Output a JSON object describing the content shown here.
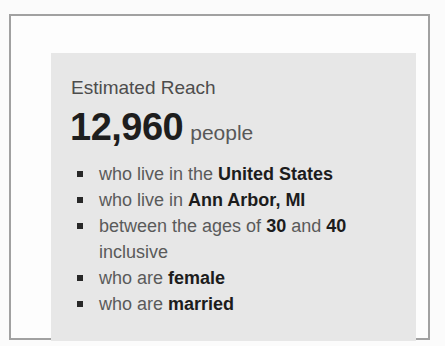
{
  "panel": {
    "title": "Estimated Reach",
    "reach_count": "12,960",
    "reach_unit": "people",
    "criteria": [
      {
        "segments": [
          {
            "t": "who live in the ",
            "b": false
          },
          {
            "t": "United States",
            "b": true
          }
        ]
      },
      {
        "segments": [
          {
            "t": "who live in ",
            "b": false
          },
          {
            "t": "Ann Arbor, MI",
            "b": true
          }
        ]
      },
      {
        "segments": [
          {
            "t": "between the ages of ",
            "b": false
          },
          {
            "t": "30",
            "b": true
          },
          {
            "t": " and ",
            "b": false
          },
          {
            "t": "40",
            "b": true
          },
          {
            "t": " inclusive",
            "b": false
          }
        ]
      },
      {
        "segments": [
          {
            "t": "who are ",
            "b": false
          },
          {
            "t": "female",
            "b": true
          }
        ]
      },
      {
        "segments": [
          {
            "t": "who are ",
            "b": false
          },
          {
            "t": "married",
            "b": true
          }
        ]
      }
    ]
  }
}
